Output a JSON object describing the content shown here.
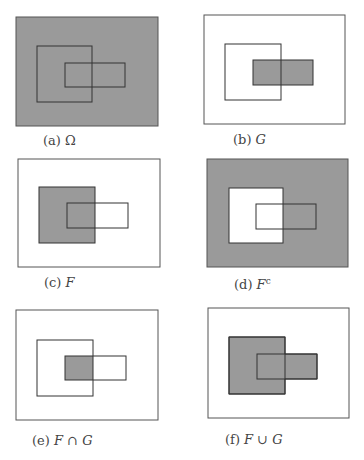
{
  "figure": {
    "colors": {
      "shade": "#9a9a9a",
      "stroke": "#333333",
      "outer_stroke": "#555555",
      "background": "#ffffff"
    },
    "panels": [
      {
        "id": "a",
        "label": "(a)",
        "set": "Ω",
        "sup": "",
        "shaded": "outer"
      },
      {
        "id": "b",
        "label": "(b)",
        "set": "G",
        "sup": "",
        "shaded": "G"
      },
      {
        "id": "c",
        "label": "(c)",
        "set": "F",
        "sup": "",
        "shaded": "F"
      },
      {
        "id": "d",
        "label": "(d)",
        "set": "F",
        "sup": "c",
        "shaded": "complement-F"
      },
      {
        "id": "e",
        "label": "(e)",
        "set": "F ∩ G",
        "sup": "",
        "shaded": "intersection"
      },
      {
        "id": "f",
        "label": "(f)",
        "set": "F ∪ G",
        "sup": "",
        "shaded": "union"
      }
    ]
  }
}
